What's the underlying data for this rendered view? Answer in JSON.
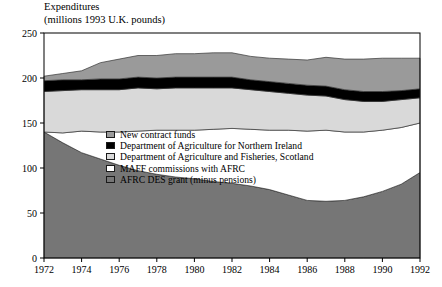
{
  "title": {
    "line1": "Expenditures",
    "line2": "(millions 1993 U.K. pounds)"
  },
  "legend": {
    "items": [
      {
        "label": "New contract funds",
        "color": "#9a9a9a"
      },
      {
        "label": "Department of Agriculture for Northern Ireland",
        "color": "#000000"
      },
      {
        "label": "Department of Agriculture and Fisheries, Scotland",
        "color": "#d9d9d9"
      },
      {
        "label": "MAFF commissions with AFRC",
        "color": "#ffffff"
      },
      {
        "label": "AFRC DES grant (minus pensions)",
        "color": "#767676"
      }
    ]
  },
  "axes": {
    "y_ticks": [
      "0",
      "50",
      "100",
      "150",
      "200",
      "250"
    ],
    "x_ticks": [
      "1972",
      "1974",
      "1976",
      "1978",
      "1980",
      "1982",
      "1984",
      "1986",
      "1988",
      "1990",
      "1992"
    ]
  },
  "chart_data": {
    "type": "area",
    "title": "Expenditures (millions 1993 U.K. pounds)",
    "xlabel": "",
    "ylabel": "Expenditures (millions 1993 U.K. pounds)",
    "xlim": [
      1972,
      1992
    ],
    "ylim": [
      0,
      250
    ],
    "grid": false,
    "stacked": true,
    "legend_position": "inside-center-left",
    "x": [
      1972,
      1973,
      1974,
      1975,
      1976,
      1977,
      1978,
      1979,
      1980,
      1981,
      1982,
      1983,
      1984,
      1985,
      1986,
      1987,
      1988,
      1989,
      1990,
      1991,
      1992
    ],
    "series": [
      {
        "name": "AFRC DES grant (minus pensions)",
        "color": "#767676",
        "values": [
          140,
          128,
          117,
          110,
          103,
          97,
          93,
          90,
          88,
          85,
          83,
          80,
          76,
          70,
          64,
          63,
          64,
          68,
          74,
          82,
          95
        ]
      },
      {
        "name": "MAFF commissions with AFRC",
        "color": "#ffffff",
        "values": [
          0,
          11,
          24,
          30,
          37,
          44,
          49,
          52,
          54,
          58,
          61,
          63,
          66,
          72,
          77,
          79,
          76,
          72,
          68,
          63,
          55
        ]
      },
      {
        "name": "Department of Agriculture and Fisheries, Scotland",
        "color": "#d9d9d9",
        "values": [
          45,
          47,
          46,
          47,
          47,
          48,
          46,
          47,
          47,
          46,
          45,
          44,
          43,
          41,
          40,
          38,
          36,
          34,
          32,
          31,
          28
        ]
      },
      {
        "name": "Department of Agriculture for Northern Ireland",
        "color": "#000000",
        "values": [
          12,
          12,
          11,
          12,
          12,
          12,
          12,
          12,
          12,
          12,
          12,
          11,
          11,
          11,
          11,
          11,
          11,
          11,
          11,
          10,
          10
        ]
      },
      {
        "name": "New contract funds",
        "color": "#9a9a9a",
        "values": [
          5,
          7,
          10,
          18,
          22,
          24,
          25,
          26,
          26,
          27,
          27,
          26,
          26,
          27,
          28,
          32,
          34,
          36,
          37,
          36,
          34
        ]
      }
    ],
    "totals": [
      202,
      205,
      208,
      217,
      221,
      225,
      225,
      227,
      227,
      228,
      228,
      224,
      222,
      221,
      220,
      223,
      221,
      221,
      222,
      222,
      222
    ]
  }
}
